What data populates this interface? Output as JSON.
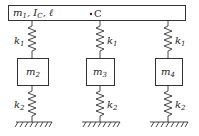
{
  "diagram": {
    "type": "mass-spring system",
    "top_body": {
      "label_parts": [
        "m",
        "1",
        ", I",
        "C",
        ", ℓ"
      ],
      "label": "m1, IC, ℓ",
      "center_marker": "C"
    },
    "columns": [
      {
        "upper_spring": "k1",
        "upper_spring_sub": "1",
        "mass": "m",
        "mass_sub": "2",
        "lower_spring": "k",
        "lower_spring_sub": "2",
        "label_side": "left"
      },
      {
        "upper_spring": "k1",
        "upper_spring_sub": "1",
        "mass": "m",
        "mass_sub": "3",
        "lower_spring": "k",
        "lower_spring_sub": "2",
        "label_side": "right"
      },
      {
        "upper_spring": "k1",
        "upper_spring_sub": "1",
        "mass": "m",
        "mass_sub": "4",
        "lower_spring": "k",
        "lower_spring_sub": "2",
        "label_side": "right"
      }
    ],
    "spring_k": "k",
    "colors": {
      "line": "#333333",
      "fill": "#ffffff"
    }
  }
}
